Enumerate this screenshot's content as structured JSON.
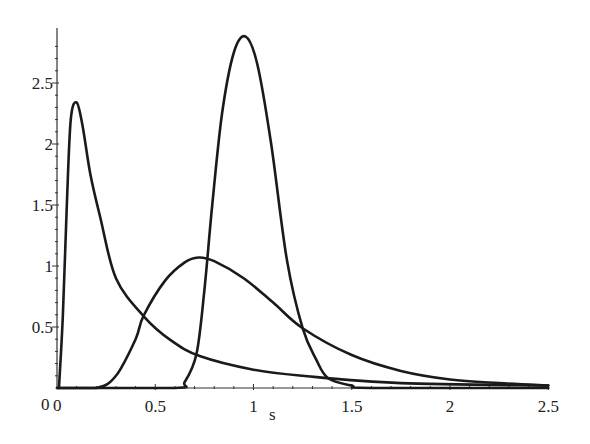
{
  "chart_data": {
    "type": "line",
    "title": "",
    "xlabel": "s",
    "ylabel": "",
    "xlim": [
      0,
      2.5
    ],
    "ylim": [
      0,
      2.9
    ],
    "grid": false,
    "legend": null,
    "x_ticks": [
      "0",
      "0.5",
      "1",
      "1.5",
      "2",
      "2.5"
    ],
    "y_ticks": [
      "0.5",
      "1",
      "1.5",
      "2",
      "2.5"
    ],
    "origin_label": "0",
    "series": [
      {
        "name": "curve-1",
        "x": [
          0.01,
          0.03,
          0.05,
          0.07,
          0.1,
          0.13,
          0.17,
          0.22,
          0.3,
          0.44,
          0.58,
          0.73,
          1.0,
          1.25,
          1.75,
          2.5
        ],
        "y": [
          0.0,
          0.6,
          1.5,
          2.2,
          2.34,
          2.15,
          1.75,
          1.4,
          0.9,
          0.59,
          0.39,
          0.26,
          0.15,
          0.1,
          0.04,
          0.02
        ]
      },
      {
        "name": "curve-2",
        "x": [
          0.0,
          0.2,
          0.3,
          0.4,
          0.44,
          0.55,
          0.65,
          0.72,
          0.8,
          0.95,
          1.1,
          1.25,
          1.5,
          1.75,
          2.0,
          2.25,
          2.5
        ],
        "y": [
          0.0,
          0.0,
          0.1,
          0.4,
          0.59,
          0.88,
          1.03,
          1.07,
          1.04,
          0.9,
          0.7,
          0.49,
          0.27,
          0.14,
          0.07,
          0.04,
          0.02
        ]
      },
      {
        "name": "curve-3",
        "x": [
          0.0,
          0.6,
          0.65,
          0.71,
          0.75,
          0.79,
          0.84,
          0.9,
          0.96,
          1.02,
          1.09,
          1.17,
          1.25,
          1.32,
          1.38,
          1.5,
          1.6,
          2.5
        ],
        "y": [
          0.0,
          0.0,
          0.05,
          0.28,
          0.8,
          1.5,
          2.25,
          2.75,
          2.88,
          2.65,
          2.0,
          1.05,
          0.49,
          0.23,
          0.08,
          0.02,
          0.0,
          0.0
        ]
      }
    ]
  },
  "axes": {
    "x_label": "s",
    "origin_x": "0",
    "origin_y": "0"
  }
}
